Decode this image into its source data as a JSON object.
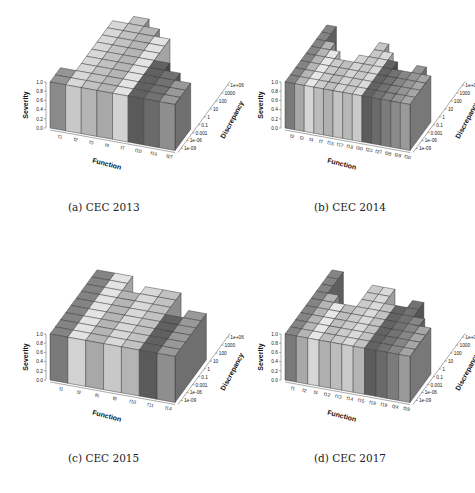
{
  "chart_data": [
    {
      "type": "bar3d",
      "caption": "(a) CEC 2013",
      "xlabel": "Function",
      "ylabel": "Discrepancy",
      "zlabel": "Severity",
      "z_ticks": [
        "0.0",
        "0.2",
        "0.4",
        "0.6",
        "0.8",
        "1.0"
      ],
      "y_ticks": [
        "1e-09",
        "1e-06",
        "0.001",
        "0.1",
        "1",
        "10",
        "100",
        "1000",
        "1e+06"
      ],
      "categories": [
        "f1",
        "f2",
        "f3",
        "f4",
        "f7",
        "f10",
        "f16",
        "f27"
      ],
      "heights": [
        2,
        9,
        10,
        9,
        8,
        5,
        4,
        3
      ],
      "shades": [
        "#8a8a8a",
        "#c8c8c8",
        "#b4b4b4",
        "#a8a8a8",
        "#d2d2d2",
        "#5a5a5a",
        "#6a6a6a",
        "#8e8e8e"
      ]
    },
    {
      "type": "bar3d",
      "caption": "(b) CEC 2014",
      "xlabel": "Function",
      "ylabel": "Discrepancy",
      "zlabel": "Severity",
      "z_ticks": [
        "0.0",
        "0.2",
        "0.4",
        "0.6",
        "0.8",
        "1.0"
      ],
      "y_ticks": [
        "1e-09",
        "1e-06",
        "0.001",
        "0.1",
        "1",
        "10",
        "100",
        "1000",
        "1e+06"
      ],
      "categories": [
        "f2",
        "f3",
        "f4",
        "f7",
        "f15",
        "f17",
        "f18",
        "f20",
        "f23",
        "f27",
        "f28",
        "f29",
        "f30"
      ],
      "heights": [
        8,
        6,
        5,
        4,
        4,
        5,
        7,
        6,
        5,
        4,
        4,
        5,
        4
      ],
      "shades": [
        "#7a7a7a",
        "#a8a8a8",
        "#d6d6d6",
        "#bcbcbc",
        "#b0b0b0",
        "#c4c4c4",
        "#b8b8b8",
        "#cacaca",
        "#5c5c5c",
        "#6a6a6a",
        "#7c7c7c",
        "#8a8a8a",
        "#9a9a9a"
      ]
    },
    {
      "type": "bar3d",
      "caption": "(c) CEC 2015",
      "xlabel": "Function",
      "ylabel": "Discrepancy",
      "zlabel": "Severity",
      "z_ticks": [
        "0.0",
        "0.2",
        "0.4",
        "0.6",
        "0.8",
        "1.0"
      ],
      "y_ticks": [
        "1e-09",
        "1e-06",
        "0.001",
        "0.1",
        "1",
        "10",
        "100",
        "1000",
        "1e+06"
      ],
      "categories": [
        "f1",
        "f2",
        "f6",
        "f8",
        "f10",
        "f11",
        "f14"
      ],
      "heights": [
        9,
        9,
        7,
        8,
        8,
        5,
        6
      ],
      "shades": [
        "#7a7a7a",
        "#d2d2d2",
        "#a8a8a8",
        "#c8c8c8",
        "#b4b4b4",
        "#5a5a5a",
        "#8e8e8e"
      ]
    },
    {
      "type": "bar3d",
      "caption": "(d) CEC 2017",
      "xlabel": "Function",
      "ylabel": "Discrepancy",
      "zlabel": "Severity",
      "z_ticks": [
        "0.0",
        "0.2",
        "0.4",
        "0.6",
        "0.8",
        "1.0"
      ],
      "y_ticks": [
        "1e-09",
        "1e-06",
        "0.001",
        "0.1",
        "1",
        "10",
        "100",
        "1000",
        "1e+06"
      ],
      "categories": [
        "f1",
        "f2",
        "f4",
        "f12",
        "f13",
        "f14",
        "f15",
        "f18",
        "f19",
        "f24",
        "f28"
      ],
      "heights": [
        9,
        6,
        5,
        5,
        8,
        8,
        6,
        6,
        7,
        5,
        4
      ],
      "shades": [
        "#7a7a7a",
        "#a8a8a8",
        "#d6d6d6",
        "#b0b0b0",
        "#bcbcbc",
        "#cacaca",
        "#b4b4b4",
        "#5c5c5c",
        "#6a6a6a",
        "#7c7c7c",
        "#9a9a9a"
      ]
    }
  ],
  "layout": {
    "panels": [
      {
        "left": 10,
        "top": 0,
        "caption_left": 68,
        "caption_top": 201
      },
      {
        "left": 245,
        "top": 0,
        "caption_left": 314,
        "caption_top": 201
      },
      {
        "left": 10,
        "top": 240,
        "caption_left": 68,
        "caption_top": 452
      },
      {
        "left": 245,
        "top": 240,
        "caption_left": 314,
        "caption_top": 452
      }
    ]
  }
}
